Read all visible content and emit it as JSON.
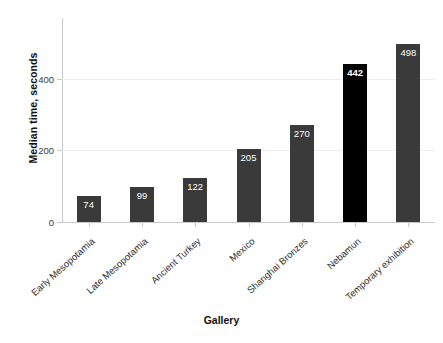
{
  "chart_data": {
    "type": "bar",
    "title": "",
    "xlabel": "Gallery",
    "ylabel": "Median time, seconds",
    "categories": [
      "Early Mesopotamia",
      "Late Mesopotamia",
      "Ancient Turkey",
      "Mexico",
      "Shanghai Bronzes",
      "Nebamun",
      "Temporary exhibition"
    ],
    "values": [
      74,
      99,
      122,
      205,
      270,
      442,
      498
    ],
    "value_labels": [
      "74",
      "99",
      "122",
      "205",
      "270",
      "442",
      "498"
    ],
    "ylim": [
      0,
      570
    ],
    "yticks": [
      0,
      200,
      400
    ],
    "ytick_labels": [
      "0",
      "200",
      "400"
    ],
    "grid": "horizontal",
    "legend": "none",
    "bar_color": "#3a3a3a",
    "highlight_color": "#000000",
    "highlight_category": "Nebamun",
    "background_color": "#ffffff",
    "gridline_color": "#ededef",
    "axis_color": "#c9c9c9"
  }
}
